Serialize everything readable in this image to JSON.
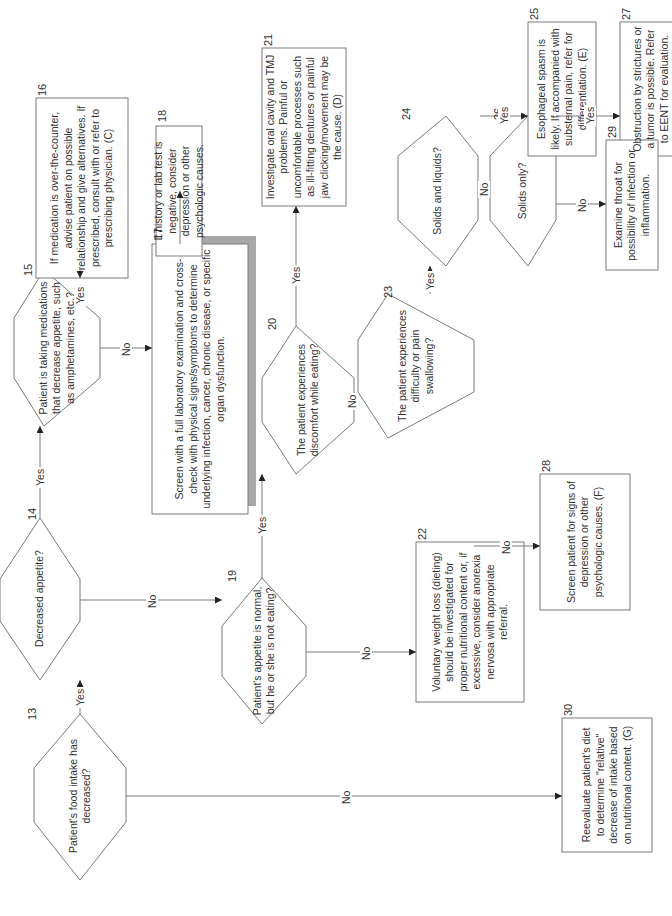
{
  "diagram": {
    "type": "flowchart",
    "orientation": "rotated-90-ccw",
    "colors": {
      "line": "#7a7a7a",
      "text": "#333333",
      "shadow": "#a8a8a8",
      "background": "#ffffff"
    },
    "nodes": {
      "n13": {
        "id": "13",
        "shape": "decision",
        "text": "Patient's food intake has decreased?"
      },
      "n14": {
        "id": "14",
        "shape": "decision",
        "text": "Decreased appetite?"
      },
      "n15": {
        "id": "15",
        "shape": "decision",
        "text": "Patient is taking medications that decrease appetite, such as amphetamines, etc.?"
      },
      "n16": {
        "id": "16",
        "shape": "process",
        "text": "If medication is over-the-counter, advise patient on possible relationship and give alternatives. If prescribed, consult with or refer to prescribing physician. (C)"
      },
      "n17": {
        "id": "17",
        "shape": "process-shadow",
        "text": "Screen with a full laboratory examination and cross-check with physical signs/symptoms to determine underlying infection, cancer, chronic disease, or specific organ dysfunction."
      },
      "n18": {
        "id": "18",
        "shape": "process",
        "text": "If history or lab test is negative, consider depression or other psychologic causes."
      },
      "n19": {
        "id": "19",
        "shape": "decision",
        "text": "Patient's appetite is normal, but he or she is not eating?"
      },
      "n20": {
        "id": "20",
        "shape": "decision",
        "text": "The patient experiences discomfort while eating?"
      },
      "n21": {
        "id": "21",
        "shape": "process",
        "text": "Investigate oral cavity and TMJ problems. Painful or uncomfortable processes such as ill-fitting dentures or painful jaw clicking/movement may be the cause. (D)"
      },
      "n22": {
        "id": "22",
        "shape": "process",
        "text": "Voluntary weight loss (dieting) should be investigated for proper nutritional content or, if excessive, consider anorexia nervosa with appropriate referral."
      },
      "n23": {
        "id": "23",
        "shape": "decision",
        "text": "The patient experiences difficulty or pain swallowing?"
      },
      "n24": {
        "id": "24",
        "shape": "decision",
        "text": "Solids and liquids?"
      },
      "n25": {
        "id": "25",
        "shape": "process",
        "text": "Esophageal spasm is likely. If accompanied with substernal pain, refer for differentiation. (E)"
      },
      "n26": {
        "id": "26",
        "shape": "decision",
        "text": "Solids only?"
      },
      "n27": {
        "id": "27",
        "shape": "process",
        "text": "Obstruction by strictures or a tumor is possible. Refer to EENT for evaluation."
      },
      "n28": {
        "id": "28",
        "shape": "process",
        "text": "Screen patient for signs of depression or other psychologic causes. (F)"
      },
      "n29": {
        "id": "29",
        "shape": "process",
        "text": "Examine throat for possibility of infection or inflammation."
      },
      "n30": {
        "id": "30",
        "shape": "process",
        "text": "Reevaluate patient's diet to determine \"relative\" decrease of intake based on nutritional content. (G)"
      }
    },
    "edges": [
      {
        "from": "13",
        "to": "14",
        "label": "Yes"
      },
      {
        "from": "13",
        "to": "30",
        "label": "No"
      },
      {
        "from": "14",
        "to": "15",
        "label": "Yes"
      },
      {
        "from": "14",
        "to": "19",
        "label": "No"
      },
      {
        "from": "15",
        "to": "16",
        "label": "Yes"
      },
      {
        "from": "15",
        "to": "17",
        "label": "No"
      },
      {
        "from": "17",
        "to": "18",
        "label": ""
      },
      {
        "from": "19",
        "to": "20",
        "label": "Yes"
      },
      {
        "from": "19",
        "to": "22",
        "label": "No"
      },
      {
        "from": "20",
        "to": "21",
        "label": "Yes"
      },
      {
        "from": "20",
        "to": "23",
        "label": "No"
      },
      {
        "from": "23",
        "to": "24",
        "label": "Yes"
      },
      {
        "from": "23",
        "to": "28",
        "label": "No"
      },
      {
        "from": "24",
        "to": "25",
        "label": "Yes"
      },
      {
        "from": "24",
        "to": "26",
        "label": "No"
      },
      {
        "from": "26",
        "to": "27",
        "label": "Yes"
      },
      {
        "from": "26",
        "to": "29",
        "label": "No"
      }
    ],
    "labels": {
      "yes": "Yes",
      "no": "No"
    }
  }
}
